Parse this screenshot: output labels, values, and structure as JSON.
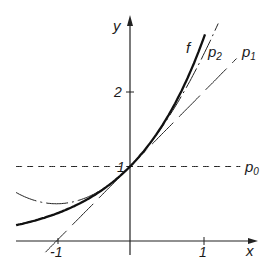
{
  "chart_data": {
    "type": "line",
    "title": "",
    "xlabel": "x",
    "ylabel": "y",
    "xlim": [
      -1.55,
      1.75
    ],
    "ylim": [
      -0.2,
      3.0
    ],
    "x_ticks": [
      -1,
      1
    ],
    "x_tick_labels": [
      "-1",
      "1"
    ],
    "y_ticks": [
      1,
      2
    ],
    "y_tick_labels": [
      "1",
      "2"
    ],
    "grid": false,
    "legend": "inline labels",
    "series": [
      {
        "name": "f",
        "label": "f",
        "formula": "e^x",
        "style": "solid-thick",
        "x_range": [
          -1.55,
          1.02
        ]
      },
      {
        "name": "p0",
        "label": "p",
        "subscript": "0",
        "formula": "1",
        "style": "dashed",
        "x_range": [
          -1.55,
          1.5
        ]
      },
      {
        "name": "p1",
        "label": "p",
        "subscript": "1",
        "formula": "1 + x",
        "style": "long-dash",
        "x_range": [
          -1.15,
          1.45
        ]
      },
      {
        "name": "p2",
        "label": "p",
        "subscript": "2",
        "formula": "1 + x + x^2/2",
        "style": "dash-dot",
        "x_range": [
          -1.55,
          1.2
        ]
      }
    ],
    "sample_points": {
      "x": [
        -1.5,
        -1,
        -0.5,
        0,
        0.5,
        1
      ],
      "f": [
        0.22,
        0.37,
        0.61,
        1.0,
        1.65,
        2.72
      ],
      "p0": [
        1,
        1,
        1,
        1,
        1,
        1
      ],
      "p1": [
        -0.5,
        0,
        0.5,
        1,
        1.5,
        2
      ],
      "p2": [
        0.625,
        0.5,
        0.625,
        1,
        1.625,
        2.5
      ]
    }
  },
  "labels": {
    "x_axis": "x",
    "y_axis": "y",
    "f": "f",
    "p0": "p",
    "p0_sub": "0",
    "p1": "p",
    "p1_sub": "1",
    "p2": "p",
    "p2_sub": "2",
    "tick_x_neg1": "-1",
    "tick_x_1": "1",
    "tick_y_1": "1",
    "tick_y_2": "2"
  }
}
